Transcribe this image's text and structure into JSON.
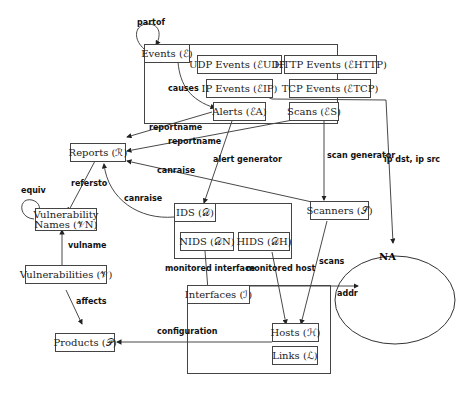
{
  "diagram": {
    "nodes": {
      "events": "Events (ℰ)",
      "udp_events": "UDP Events (ℰUDP)",
      "http_events": "HTTP Events (ℰHTTP)",
      "ip_events": "IP Events (ℰIP)",
      "tcp_events": "TCP Events (ℰTCP)",
      "alerts": "Alerts (ℰA)",
      "scans": "Scans (ℰS)",
      "reports": "Reports (ℛ)",
      "vuln_names_line1": "Vulnerability",
      "vuln_names_line2": "Names (𝒱N)",
      "vulnerabilities": "Vulnerabilities (𝒱)",
      "products": "Products (𝒫)",
      "ids": "IDS (𝒟)",
      "nids": "NIDS (𝒟N)",
      "hids": "HIDS (𝒟H)",
      "scanners": "Scanners (𝒮)",
      "interfaces": "Interfaces (ℐ)",
      "hosts": "Hosts (ℋ)",
      "links": "Links (ℒ)",
      "network": "NA"
    },
    "edges": {
      "partof": "partof",
      "causes": "causes",
      "reportname1": "reportname",
      "reportname2": "reportname",
      "refersto": "refersto",
      "equiv": "equiv",
      "canraise1": "canraise",
      "canraise2": "canraise",
      "alert_generator": "alert generator",
      "scan_generator": "scan generator",
      "ip_dst_src": "ip dst, ip src",
      "vulname": "vulname",
      "affects": "affects",
      "monitored_interface": "monitored interface",
      "monitored_host": "monitored host",
      "scans": "scans",
      "addr": "addr",
      "configuration": "configuration"
    }
  }
}
